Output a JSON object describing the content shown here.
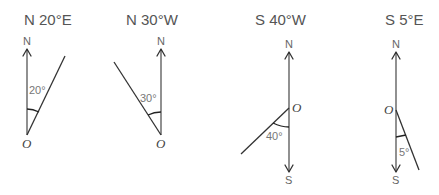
{
  "diagrams": [
    {
      "title": "N 20°E",
      "north": "N",
      "origin": "O",
      "angle": "20°"
    },
    {
      "title": "N 30°W",
      "north": "N",
      "origin": "O",
      "angle": "30°"
    },
    {
      "title": "S 40°W",
      "north": "N",
      "south": "S",
      "origin": "O",
      "angle": "40°"
    },
    {
      "title": "S 5°E",
      "north": "N",
      "south": "S",
      "origin": "O",
      "angle": "5°"
    }
  ],
  "colors": {
    "line": "#333333",
    "text": "#555555"
  }
}
